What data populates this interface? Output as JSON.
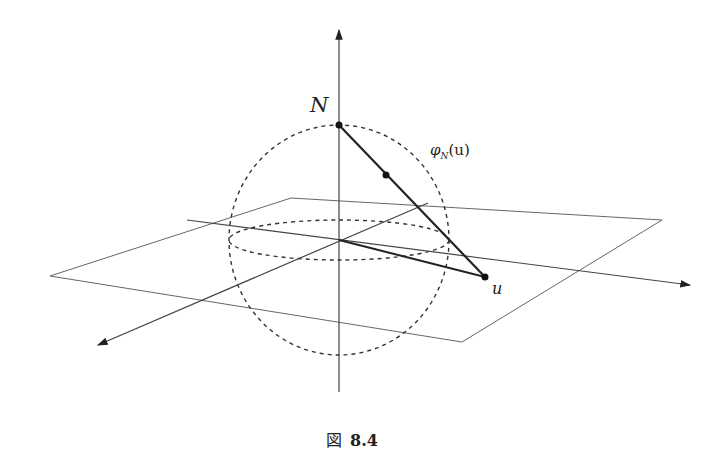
{
  "figure": {
    "labels": {
      "north_pole": "N",
      "projection": "φ",
      "projection_sub": "N",
      "projection_arg": "(u)",
      "point_u": "u"
    },
    "caption": {
      "prefix": "図",
      "number": "8.4"
    },
    "colors": {
      "line": "#333333",
      "thin_line": "#555555",
      "background": "#ffffff"
    }
  }
}
